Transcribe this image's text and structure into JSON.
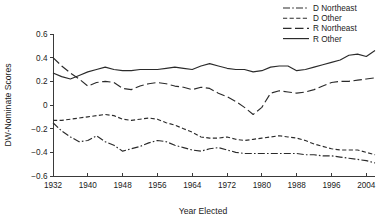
{
  "chart_data": {
    "type": "line",
    "title": "",
    "xlabel": "Year Elected",
    "ylabel": "DW-Nominate Scores",
    "xlim": [
      1932,
      2006
    ],
    "ylim": [
      -0.6,
      0.6
    ],
    "grid": false,
    "legend_position": "top-right",
    "xticks": [
      1932,
      1940,
      1948,
      1956,
      1964,
      1972,
      1980,
      1988,
      1996,
      2004
    ],
    "xtick_labels": [
      "1932",
      "1940",
      "1948",
      "1956",
      "1964",
      "1972",
      "1980",
      "1988",
      "1996",
      "2004"
    ],
    "yticks": [
      0.6,
      0.4,
      0.2,
      0,
      -0.2,
      -0.4,
      -0.6
    ],
    "ytick_labels": [
      "0.6",
      "0.4",
      "0.2",
      "0",
      "−0.2",
      "−0.4",
      "−0.6"
    ],
    "x": [
      1932,
      1934,
      1936,
      1938,
      1940,
      1942,
      1944,
      1946,
      1948,
      1950,
      1952,
      1954,
      1956,
      1958,
      1960,
      1962,
      1964,
      1966,
      1968,
      1970,
      1972,
      1974,
      1976,
      1978,
      1980,
      1982,
      1984,
      1986,
      1988,
      1990,
      1992,
      1994,
      1996,
      1998,
      2000,
      2002,
      2004,
      2006
    ],
    "series": [
      {
        "name": "D Northeast",
        "linestyle": "dashdot",
        "dasharray": "7,2.2,1.6,2.2",
        "values": [
          -0.15,
          -0.22,
          -0.27,
          -0.31,
          -0.3,
          -0.26,
          -0.31,
          -0.34,
          -0.39,
          -0.37,
          -0.35,
          -0.32,
          -0.3,
          -0.31,
          -0.34,
          -0.36,
          -0.38,
          -0.39,
          -0.37,
          -0.36,
          -0.38,
          -0.4,
          -0.41,
          -0.41,
          -0.41,
          -0.41,
          -0.41,
          -0.41,
          -0.41,
          -0.42,
          -0.42,
          -0.43,
          -0.43,
          -0.44,
          -0.45,
          -0.46,
          -0.47,
          -0.49
        ]
      },
      {
        "name": "D Other",
        "linestyle": "dashed-short",
        "dasharray": "4.2,2.4",
        "values": [
          -0.13,
          -0.13,
          -0.12,
          -0.11,
          -0.1,
          -0.09,
          -0.08,
          -0.09,
          -0.12,
          -0.13,
          -0.12,
          -0.11,
          -0.12,
          -0.15,
          -0.17,
          -0.2,
          -0.23,
          -0.27,
          -0.28,
          -0.28,
          -0.27,
          -0.29,
          -0.3,
          -0.29,
          -0.28,
          -0.27,
          -0.26,
          -0.27,
          -0.28,
          -0.3,
          -0.33,
          -0.35,
          -0.37,
          -0.38,
          -0.38,
          -0.38,
          -0.4,
          -0.42
        ]
      },
      {
        "name": "R Northeast",
        "linestyle": "dashed-long",
        "dasharray": "8.5,3.5",
        "values": [
          0.4,
          0.33,
          0.27,
          0.22,
          0.16,
          0.19,
          0.2,
          0.19,
          0.14,
          0.13,
          0.16,
          0.18,
          0.19,
          0.18,
          0.16,
          0.15,
          0.13,
          0.15,
          0.14,
          0.1,
          0.07,
          0.03,
          -0.02,
          -0.08,
          -0.02,
          0.1,
          0.12,
          0.11,
          0.1,
          0.11,
          0.13,
          0.16,
          0.19,
          0.2,
          0.2,
          0.21,
          0.22,
          0.23
        ]
      },
      {
        "name": "R Other",
        "linestyle": "solid",
        "dasharray": "",
        "values": [
          0.27,
          0.24,
          0.22,
          0.25,
          0.28,
          0.3,
          0.32,
          0.3,
          0.29,
          0.29,
          0.3,
          0.3,
          0.3,
          0.31,
          0.32,
          0.31,
          0.3,
          0.33,
          0.35,
          0.33,
          0.31,
          0.3,
          0.3,
          0.28,
          0.29,
          0.32,
          0.33,
          0.33,
          0.29,
          0.3,
          0.32,
          0.34,
          0.36,
          0.38,
          0.42,
          0.43,
          0.41,
          0.46
        ]
      }
    ]
  },
  "legend": {
    "items": [
      {
        "label": "D Northeast"
      },
      {
        "label": "D Other"
      },
      {
        "label": "R Northeast"
      },
      {
        "label": "R Other"
      }
    ]
  }
}
